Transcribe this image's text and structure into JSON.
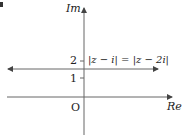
{
  "diagram": {
    "type": "argand-diagram",
    "axes": {
      "x_label": "Re",
      "y_label": "Im",
      "origin_label": "O"
    },
    "ticks": [
      {
        "label": "1",
        "value": 1
      },
      {
        "label": "2",
        "value": 2
      }
    ],
    "locus": {
      "equation": "|z − i| = |z − 2i|",
      "description": "horizontal line Im(z) = 1.5, arrows both ends"
    },
    "colors": {
      "stroke": "#555555",
      "text": "#222222"
    }
  }
}
